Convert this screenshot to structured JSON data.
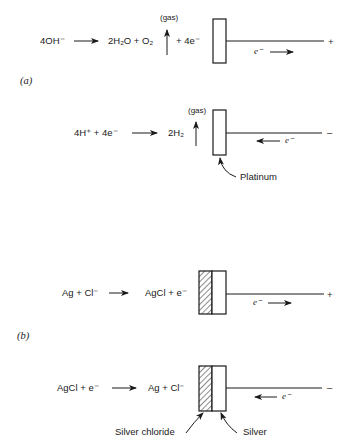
{
  "panel_a": {
    "label": "(a)",
    "anode": {
      "reactant": "4OH⁻",
      "products": "2H₂O + O₂",
      "gas_label": "(gas)",
      "electrons": "+ 4e⁻",
      "electron_flow": "e⁻",
      "terminal": "+"
    },
    "cathode": {
      "reactants": "4H⁺ + 4e⁻",
      "product": "2H₂",
      "gas_label": "(gas)",
      "electron_flow": "e⁻",
      "terminal": "–",
      "electrode_label": "Platinum"
    }
  },
  "panel_b": {
    "label": "(b)",
    "anode": {
      "reactants": "Ag + Cl⁻",
      "products": "AgCl + e⁻",
      "electron_flow": "e⁻",
      "terminal": "+"
    },
    "cathode": {
      "reactants": "AgCl + e⁻",
      "products": "Ag + Cl⁻",
      "electron_flow": "e⁻",
      "terminal": "–",
      "label_left": "Silver chloride",
      "label_right": "Silver"
    }
  },
  "colors": {
    "ink": "#1a1a1a",
    "background": "#ffffff"
  }
}
